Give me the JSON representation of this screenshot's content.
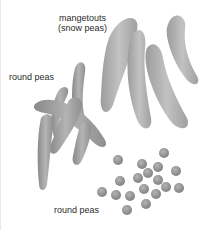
{
  "figure": {
    "labels": {
      "mangetouts_line1": "mangetouts",
      "mangetouts_line2": "(snow peas)",
      "round_peas_pods": "round peas",
      "round_peas_loose": "round peas"
    },
    "colors": {
      "background": "#ffffff",
      "pod_fill": "#a9a9a9",
      "pod_light": "#c4c4c4",
      "pea_fill": "#8f8f8f",
      "text": "#2a2a2a"
    }
  }
}
